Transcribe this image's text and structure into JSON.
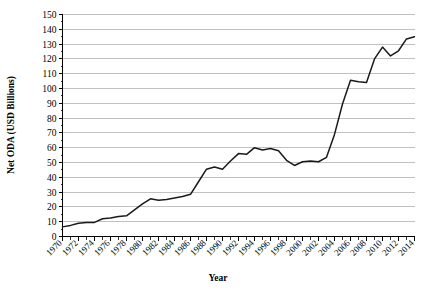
{
  "chart_data": {
    "type": "line",
    "title": "",
    "xlabel": "Year",
    "ylabel": "Net ODA (USD Billions)",
    "xlim": [
      1970,
      2014
    ],
    "ylim": [
      0,
      150
    ],
    "ytick_step": 10,
    "xtick_step": 2,
    "xminor_step": 1,
    "grid": "horizontal",
    "legend": "none",
    "line_color": "#1a1a1a",
    "grid_color": "#a6a6a6",
    "axis_color": "#000000",
    "yticks": [
      0,
      10,
      20,
      30,
      40,
      50,
      60,
      70,
      80,
      90,
      100,
      110,
      120,
      130,
      140,
      150
    ],
    "ytick_labels": [
      "0",
      "10",
      "20",
      "30",
      "40",
      "50",
      "60",
      "70",
      "80",
      "90",
      "100",
      "110",
      "120",
      "130",
      "140",
      "150"
    ],
    "xticks": [
      1970,
      1972,
      1974,
      1976,
      1978,
      1980,
      1982,
      1984,
      1986,
      1988,
      1990,
      1992,
      1994,
      1996,
      1998,
      2000,
      2002,
      2004,
      2006,
      2008,
      2010,
      2012,
      2014
    ],
    "xtick_labels": [
      "1970",
      "1972",
      "1974",
      "1976",
      "1978",
      "1980",
      "1982",
      "1984",
      "1986",
      "1988",
      "1990",
      "1992",
      "1994",
      "1996",
      "1998",
      "2000",
      "2002",
      "2004",
      "2006",
      "2008",
      "2010",
      "2012",
      "2014"
    ],
    "series": [
      {
        "name": "Net ODA",
        "x": [
          1970,
          1971,
          1972,
          1973,
          1974,
          1975,
          1976,
          1977,
          1978,
          1979,
          1980,
          1981,
          1982,
          1983,
          1984,
          1985,
          1986,
          1987,
          1988,
          1989,
          1990,
          1991,
          1992,
          1993,
          1994,
          1995,
          1996,
          1997,
          1998,
          1999,
          2000,
          2001,
          2002,
          2003,
          2004,
          2005,
          2006,
          2007,
          2008,
          2009,
          2010,
          2011,
          2012,
          2013,
          2014
        ],
        "values": [
          6.5,
          7.5,
          9.0,
          9.5,
          9.5,
          12.0,
          12.5,
          13.5,
          14.0,
          18.0,
          22.0,
          25.5,
          24.5,
          25.0,
          26.0,
          27.0,
          28.5,
          37.0,
          45.5,
          47.0,
          45.5,
          51.0,
          56.0,
          55.5,
          60.0,
          58.5,
          59.5,
          58.0,
          51.5,
          48.0,
          50.5,
          51.0,
          50.5,
          53.5,
          69.0,
          89.5,
          105.5,
          104.5,
          104.0,
          120.0,
          128.0,
          122.0,
          125.5,
          133.5,
          135.0
        ]
      }
    ]
  },
  "axes": {
    "x_title": "Year",
    "y_title": "Net ODA (USD Billions)"
  }
}
